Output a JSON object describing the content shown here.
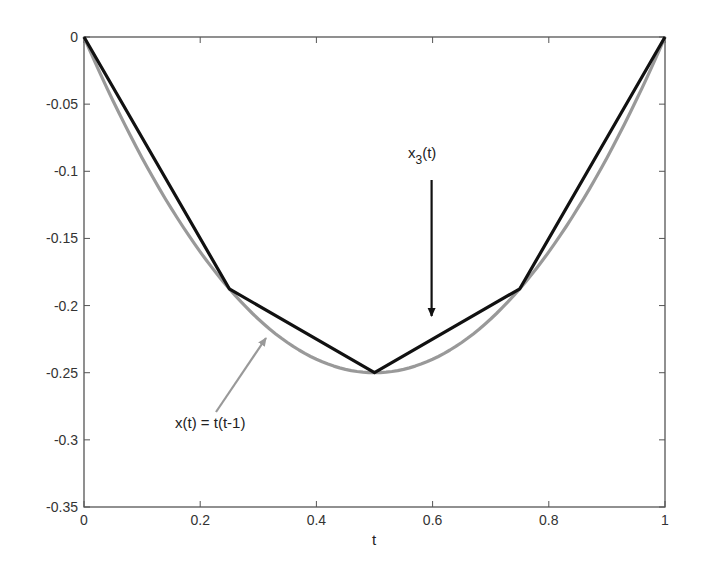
{
  "chart_data": {
    "type": "line",
    "title": "",
    "xlabel": "t",
    "ylabel": "",
    "xlim": [
      0,
      1
    ],
    "ylim": [
      -0.35,
      0
    ],
    "grid": false,
    "legend": null,
    "x_ticks": [
      0,
      0.2,
      0.4,
      0.6,
      0.8,
      1
    ],
    "x_tick_labels": [
      "0",
      "0.2",
      "0.4",
      "0.6",
      "0.8",
      "1"
    ],
    "y_ticks": [
      0,
      -0.05,
      -0.1,
      -0.15,
      -0.2,
      -0.25,
      -0.3,
      -0.35
    ],
    "y_tick_labels": [
      "0",
      "-0.05",
      "-0.1",
      "-0.15",
      "-0.2",
      "-0.25",
      "-0.3",
      "-0.35"
    ],
    "series": [
      {
        "name": "x(t) = t(t-1)",
        "color": "#999999",
        "kind": "curve",
        "x": [
          0,
          0.05,
          0.1,
          0.15,
          0.2,
          0.25,
          0.3,
          0.35,
          0.4,
          0.45,
          0.5,
          0.55,
          0.6,
          0.65,
          0.7,
          0.75,
          0.8,
          0.85,
          0.9,
          0.95,
          1
        ],
        "values": [
          0,
          -0.0475,
          -0.09,
          -0.1275,
          -0.16,
          -0.1875,
          -0.21,
          -0.2275,
          -0.24,
          -0.2475,
          -0.25,
          -0.2475,
          -0.24,
          -0.2275,
          -0.21,
          -0.1875,
          -0.16,
          -0.1275,
          -0.09,
          -0.0475,
          0
        ]
      },
      {
        "name": "x_3(t)",
        "color": "#111111",
        "kind": "piecewise-linear",
        "x": [
          0,
          0.25,
          0.5,
          0.75,
          1
        ],
        "values": [
          0,
          -0.1875,
          -0.25,
          -0.1875,
          0
        ]
      }
    ],
    "annotations": [
      {
        "text_main": "x",
        "text_sub": "3",
        "text_tail": "(t)",
        "arrow_color": "#111111",
        "arrow_from": [
          0.6,
          -0.105
        ],
        "arrow_to": [
          0.6,
          -0.21
        ]
      },
      {
        "text": "x(t) =  t(t-1)",
        "arrow_color": "#999999",
        "arrow_from": [
          0.225,
          -0.28
        ],
        "arrow_to": [
          0.31,
          -0.225
        ]
      }
    ]
  }
}
